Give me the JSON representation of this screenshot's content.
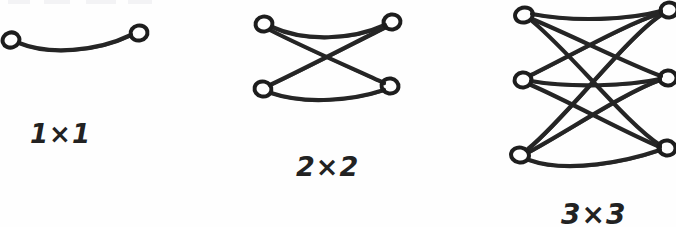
{
  "figure": {
    "background_color": "#fefefe",
    "ink_color": "#262626",
    "stroke_width": 4.2,
    "node_stroke_width": 4.0
  },
  "graphs": [
    {
      "id": "graph-1x1",
      "caption": "1×1",
      "caption_x": 30,
      "caption_y": 143,
      "caption_size": 26,
      "left_count": 1,
      "right_count": 1,
      "edge_count": 1,
      "left_nodes": [
        {
          "cx": 11,
          "cy": 40,
          "rx": 8.5,
          "ry": 7.5,
          "rot": -18
        }
      ],
      "right_nodes": [
        {
          "cx": 139,
          "cy": 33,
          "rx": 8.5,
          "ry": 7.5,
          "rot": -12
        }
      ],
      "edges": [
        {
          "d": "M 19 43 C 48 55, 96 52, 131 35"
        }
      ]
    },
    {
      "id": "graph-2x2",
      "caption": "2×2",
      "caption_x": 296,
      "caption_y": 176,
      "caption_size": 27,
      "left_count": 2,
      "right_count": 2,
      "edge_count": 4,
      "left_nodes": [
        {
          "cx": 264,
          "cy": 24,
          "rx": 8.5,
          "ry": 7.5,
          "rot": -10
        },
        {
          "cx": 263,
          "cy": 89,
          "rx": 8.5,
          "ry": 7.5,
          "rot": 12
        }
      ],
      "right_nodes": [
        {
          "cx": 392,
          "cy": 22,
          "rx": 8.5,
          "ry": 7.5,
          "rot": -8
        },
        {
          "cx": 390,
          "cy": 86,
          "rx": 8.5,
          "ry": 7.5,
          "rot": 8
        }
      ],
      "edges": [
        {
          "d": "M 272 27 C 305 42, 352 40, 385 25"
        },
        {
          "d": "M 270 30 C 305 48, 356 70, 384 83"
        },
        {
          "d": "M 270 85 C 302 70, 356 42, 386 27"
        },
        {
          "d": "M 271 93 C 306 105, 354 100, 384 90"
        }
      ]
    },
    {
      "id": "graph-3x3",
      "caption": "3×3",
      "caption_x": 561,
      "caption_y": 224,
      "caption_size": 28,
      "left_count": 3,
      "right_count": 3,
      "edge_count": 9,
      "left_nodes": [
        {
          "cx": 524,
          "cy": 15,
          "rx": 9.0,
          "ry": 7.5,
          "rot": -14
        },
        {
          "cx": 523,
          "cy": 80,
          "rx": 8.5,
          "ry": 7.5,
          "rot": -6
        },
        {
          "cx": 520,
          "cy": 155,
          "rx": 9.0,
          "ry": 7.5,
          "rot": 10
        }
      ],
      "right_nodes": [
        {
          "cx": 669,
          "cy": 10,
          "rx": 8.5,
          "ry": 7.5,
          "rot": -10
        },
        {
          "cx": 668,
          "cy": 78,
          "rx": 8.5,
          "ry": 7.5,
          "rot": -4
        },
        {
          "cx": 667,
          "cy": 148,
          "rx": 8.5,
          "ry": 7.5,
          "rot": 8
        }
      ],
      "edges": [
        {
          "d": "M 532 14 C 573 22, 628 20, 661 11"
        },
        {
          "d": "M 532 19 C 573 36, 628 64, 661 76"
        },
        {
          "d": "M 532 21 C 572 54, 626 123, 660 145"
        },
        {
          "d": "M 531 75 C 570 56, 626 24, 661 13"
        },
        {
          "d": "M 531 81 C 571 88, 628 86, 660 79"
        },
        {
          "d": "M 531 85 C 570 102, 626 133, 660 147"
        },
        {
          "d": "M 528 149 C 566 118, 626 38, 661 15"
        },
        {
          "d": "M 529 152 C 568 131, 626 92, 660 80"
        },
        {
          "d": "M 529 160 C 568 174, 628 161, 660 150"
        }
      ]
    }
  ],
  "labels": {
    "one_by_one": "1×1",
    "two_by_two": "2×2",
    "three_by_three": "3×3"
  }
}
